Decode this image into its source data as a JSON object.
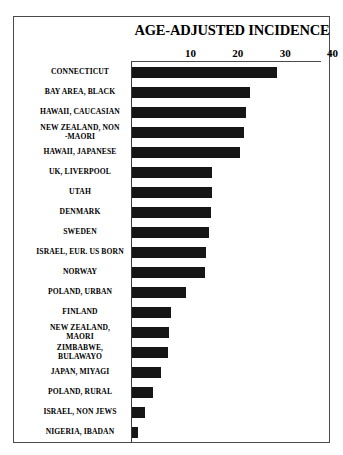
{
  "figure": {
    "title": "AGE-ADJUSTED INCIDENCE"
  },
  "chart_data": {
    "type": "bar",
    "orientation": "horizontal",
    "title": "AGE-ADJUSTED INCIDENCE",
    "xlabel": "",
    "ylabel": "",
    "xlim": [
      0,
      42
    ],
    "xticks": [
      10,
      20,
      30,
      40
    ],
    "xtick_labels": [
      "10",
      "20",
      "30",
      "40"
    ],
    "grid": false,
    "legend": null,
    "bar_color": "#161616",
    "categories": [
      "CONNECTICUT",
      "BAY AREA, BLACK",
      "HAWAII, CAUCASIAN",
      "NEW ZEALAND, NON -MAORI",
      "HAWAII, JAPANESE",
      "UK, LIVERPOOL",
      "UTAH",
      "DENMARK",
      "SWEDEN",
      "ISRAEL, EUR. US BORN",
      "NORWAY",
      "POLAND, URBAN",
      "FINLAND",
      "NEW ZEALAND, MAORI",
      "ZIMBABWE, BULAWAYO",
      "JAPAN, MIYAGI",
      "POLAND, RURAL",
      "ISRAEL, NON JEWS",
      "NIGERIA, IBADAN"
    ],
    "values": [
      30.5,
      24.8,
      24.0,
      23.6,
      22.8,
      16.9,
      16.8,
      16.6,
      16.2,
      15.7,
      15.3,
      11.3,
      8.3,
      7.9,
      7.5,
      6.2,
      4.5,
      2.8,
      1.3
    ]
  },
  "category_lines": [
    [
      "CONNECTICUT"
    ],
    [
      "BAY AREA, BLACK"
    ],
    [
      "HAWAII, CAUCASIAN"
    ],
    [
      "NEW ZEALAND, NON",
      "-MAORI"
    ],
    [
      "HAWAII, JAPANESE"
    ],
    [
      "UK, LIVERPOOL"
    ],
    [
      "UTAH"
    ],
    [
      "DENMARK"
    ],
    [
      "SWEDEN"
    ],
    [
      "ISRAEL, EUR. US BORN"
    ],
    [
      "NORWAY"
    ],
    [
      "POLAND, URBAN"
    ],
    [
      "FINLAND"
    ],
    [
      "NEW ZEALAND,",
      "MAORI"
    ],
    [
      "ZIMBABWE,",
      "BULAWAYO"
    ],
    [
      "JAPAN, MIYAGI"
    ],
    [
      "POLAND, RURAL"
    ],
    [
      "ISRAEL, NON JEWS"
    ],
    [
      "NIGERIA, IBADAN"
    ]
  ]
}
